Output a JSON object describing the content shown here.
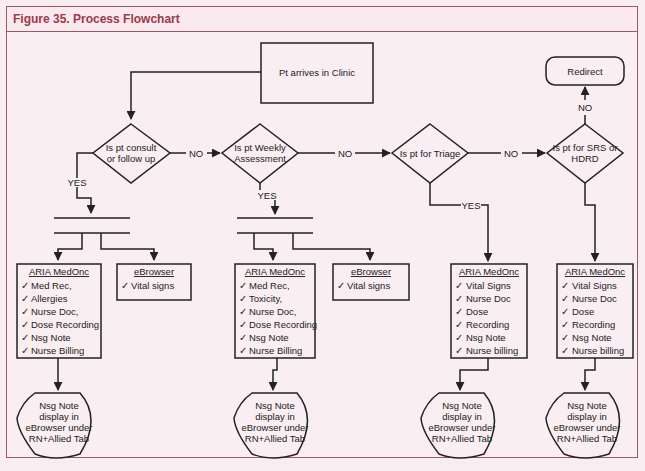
{
  "figure": {
    "title": "Figure 35. Process Flowchart"
  },
  "colors": {
    "frame_border": "#9a5a66",
    "title_color": "#9a3a4a",
    "background": "#f9eef1",
    "line": "#222222"
  },
  "nodes": {
    "start": "Pt arrives in Clinic",
    "redirect": "Redirect",
    "decisions": [
      {
        "line1": "Is pt consult",
        "line2": "or follow up"
      },
      {
        "line1": "Is pt Weekly",
        "line2": "Assessment"
      },
      {
        "line1": "Is pt for Triage",
        "line2": ""
      },
      {
        "line1": "Is pt for SRS or",
        "line2": "HDRD"
      }
    ]
  },
  "edge_labels": {
    "yes": "YES",
    "no": "NO"
  },
  "check": "✓",
  "columns": [
    {
      "aria": {
        "title": "ARIA MedOnc",
        "items": [
          "Med Rec,",
          "Allergies",
          "Nurse Doc,",
          "Dose Recording",
          "Nsg Note",
          "Nurse Billing"
        ]
      },
      "ebrowser": {
        "title": "eBrowser",
        "items": [
          "Vital signs"
        ]
      },
      "output": [
        "Nsg Note",
        "display in",
        "eBrowser under",
        "RN+Allied Tab"
      ]
    },
    {
      "aria": {
        "title": "ARIA MedOnc",
        "items": [
          "Med Rec,",
          "Toxicity,",
          "Nurse Doc,",
          "Dose Recording",
          "Nsg Note",
          "Nurse Billing"
        ]
      },
      "ebrowser": {
        "title": "eBrowser",
        "items": [
          "Vital signs"
        ]
      },
      "output": [
        "Nsg Note",
        "display in",
        "eBrowser under",
        "RN+Allied Tab"
      ]
    },
    {
      "aria": {
        "title": "ARIA MedOnc",
        "items": [
          "Vital Signs",
          "Nurse Doc",
          "Dose",
          "Recording",
          "Nsg Note",
          "Nurse billing"
        ]
      },
      "output": [
        "Nsg Note",
        "display in",
        "eBrowser under",
        "RN+Allied Tab"
      ]
    },
    {
      "aria": {
        "title": "ARIA MedOnc",
        "items": [
          "Vital Signs",
          "Nurse Doc",
          "Dose",
          "Recording",
          "Nsg Note",
          "Nurse billing"
        ]
      },
      "output": [
        "Nsg Note",
        "display in",
        "eBrowser under",
        "RN+Allied Tab"
      ]
    }
  ]
}
